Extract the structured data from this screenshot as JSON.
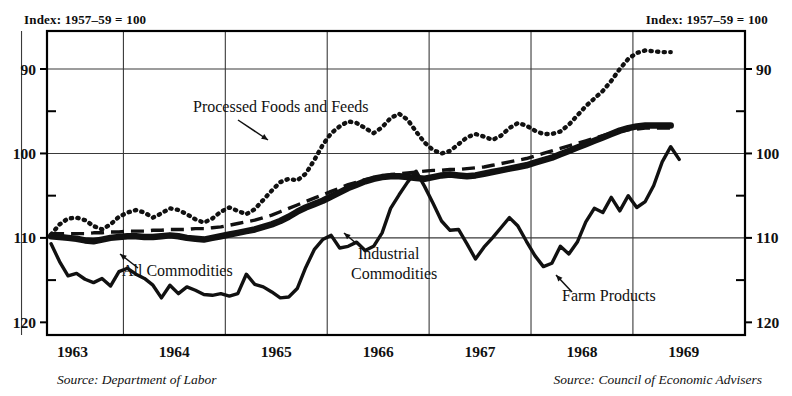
{
  "header": {
    "left_note": "Index: 1957–59 = 100",
    "right_note": "Index: 1957–59 = 100"
  },
  "sources": {
    "left": "Source: Department of Labor",
    "right": "Source: Council of Economic Advisers"
  },
  "axes": {
    "y_ticks_left": [
      "120",
      "110",
      "100",
      "90"
    ],
    "y_ticks_right": [
      "120",
      "110",
      "100",
      "90"
    ],
    "y_minor_ticks": [
      "115",
      "105",
      "95"
    ],
    "x_ticks": [
      "1963",
      "1964",
      "1965",
      "1966",
      "1967",
      "1968",
      "1969"
    ]
  },
  "annotations": [
    {
      "label": "Processed Foods and Feeds",
      "x": 193,
      "y": 112,
      "anchor": "start"
    },
    {
      "label": "All Commodities",
      "x": 122,
      "y": 276,
      "anchor": "start"
    },
    {
      "label": "Industrial",
      "x": 358,
      "y": 259,
      "anchor": "start"
    },
    {
      "label": "Commodities",
      "x": 351,
      "y": 279,
      "anchor": "start"
    },
    {
      "label": "Farm Products",
      "x": 562,
      "y": 301,
      "anchor": "start"
    }
  ],
  "colors": {
    "ink": "#111111",
    "frame": "#000000",
    "grid": "#3a3a3a",
    "background": "#ffffff"
  },
  "chart_data": {
    "type": "line",
    "xlabel": "",
    "ylabel": "Index: 1957–59 = 100",
    "ylim": [
      88.5,
      124.5
    ],
    "xlim": [
      1962.75,
      1969.6
    ],
    "grid": true,
    "legend": "inline-annotations",
    "yticks": [
      90,
      100,
      110,
      120
    ],
    "yminorticks": [
      95,
      105,
      115
    ],
    "xticks": [
      1963,
      1964,
      1965,
      1966,
      1967,
      1968,
      1969
    ],
    "x_start": 1962.79,
    "x_step": 0.0833,
    "series": [
      {
        "name": "All Commodities",
        "style": "thick-solid",
        "values": [
          100.2,
          100.1,
          100.0,
          99.9,
          99.7,
          99.6,
          99.8,
          100.0,
          100.1,
          100.2,
          100.2,
          100.1,
          100.1,
          100.2,
          100.3,
          100.2,
          100.0,
          99.9,
          99.8,
          100.0,
          100.2,
          100.4,
          100.6,
          100.8,
          101.0,
          101.3,
          101.6,
          102.0,
          102.5,
          103.1,
          103.6,
          104.0,
          104.4,
          104.9,
          105.4,
          105.9,
          106.3,
          106.7,
          107.0,
          107.2,
          107.3,
          107.3,
          107.2,
          107.1,
          107.0,
          107.2,
          107.4,
          107.5,
          107.4,
          107.3,
          107.4,
          107.6,
          107.8,
          108.0,
          108.2,
          108.4,
          108.6,
          108.9,
          109.2,
          109.5,
          109.9,
          110.3,
          110.7,
          111.1,
          111.5,
          111.9,
          112.3,
          112.7,
          113.0,
          113.2,
          113.3,
          113.3,
          113.3,
          113.3
        ]
      },
      {
        "name": "Industrial Commodities",
        "style": "dashed",
        "values": [
          100.5,
          100.5,
          100.5,
          100.5,
          100.5,
          100.6,
          100.6,
          100.7,
          100.7,
          100.8,
          100.8,
          100.8,
          100.9,
          100.9,
          101.0,
          101.0,
          101.0,
          101.1,
          101.1,
          101.2,
          101.3,
          101.5,
          101.7,
          101.9,
          102.1,
          102.4,
          102.7,
          103.1,
          103.5,
          103.9,
          104.3,
          104.7,
          105.1,
          105.5,
          105.9,
          106.3,
          106.6,
          106.9,
          107.1,
          107.3,
          107.5,
          107.6,
          107.7,
          107.8,
          107.9,
          108.0,
          108.0,
          108.1,
          108.1,
          108.2,
          108.3,
          108.4,
          108.6,
          108.8,
          109.0,
          109.2,
          109.4,
          109.7,
          110.0,
          110.3,
          110.6,
          110.9,
          111.2,
          111.5,
          111.8,
          112.1,
          112.4,
          112.6,
          112.8,
          112.9,
          113.0,
          113.0,
          113.0,
          113.0
        ]
      },
      {
        "name": "Processed Foods and Feeds",
        "style": "dotted",
        "values": [
          100.4,
          101.6,
          102.3,
          102.4,
          102.1,
          101.4,
          101.0,
          101.6,
          102.5,
          103.0,
          103.3,
          103.0,
          102.4,
          102.9,
          103.5,
          103.3,
          102.8,
          102.2,
          101.8,
          102.3,
          103.1,
          103.6,
          103.2,
          102.8,
          103.4,
          104.5,
          105.6,
          106.6,
          107.0,
          106.8,
          107.6,
          109.2,
          111.0,
          112.4,
          113.2,
          113.8,
          113.6,
          113.0,
          112.4,
          113.1,
          114.2,
          114.7,
          114.0,
          112.6,
          111.3,
          110.4,
          110.0,
          110.3,
          111.1,
          111.9,
          112.3,
          112.0,
          111.6,
          112.1,
          113.0,
          113.6,
          113.3,
          112.7,
          112.3,
          112.3,
          112.6,
          113.4,
          114.5,
          115.6,
          116.5,
          117.4,
          118.6,
          120.0,
          121.2,
          121.9,
          122.2,
          122.1,
          122.0,
          122.0
        ]
      },
      {
        "name": "Farm Products",
        "style": "medium-solid",
        "values": [
          99.3,
          97.2,
          95.5,
          95.8,
          95.1,
          94.7,
          95.2,
          94.3,
          96.0,
          96.4,
          95.7,
          95.2,
          94.4,
          92.9,
          94.4,
          93.4,
          94.2,
          93.8,
          93.3,
          93.2,
          93.4,
          93.1,
          93.4,
          95.7,
          94.5,
          94.2,
          93.6,
          92.9,
          93.0,
          94.0,
          96.5,
          98.6,
          99.8,
          100.3,
          98.8,
          99.0,
          99.5,
          98.5,
          99.0,
          100.6,
          103.5,
          105.1,
          106.6,
          107.9,
          106.1,
          104.1,
          102.0,
          100.9,
          101.0,
          99.3,
          97.5,
          98.9,
          100.0,
          101.2,
          102.4,
          101.4,
          99.6,
          97.9,
          96.6,
          97.0,
          99.0,
          98.1,
          99.5,
          101.9,
          103.5,
          103.0,
          104.8,
          103.2,
          105.0,
          103.6,
          104.3,
          106.2,
          109.0,
          110.8,
          109.3
        ]
      }
    ]
  }
}
